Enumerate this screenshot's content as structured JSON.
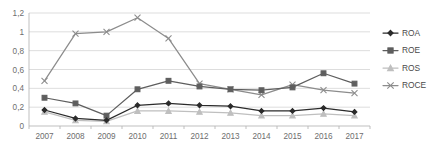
{
  "chart_data": {
    "type": "line",
    "title": "",
    "xlabel": "",
    "ylabel": "",
    "x": [
      "2007",
      "2008",
      "2009",
      "2010",
      "2011",
      "2012",
      "2013",
      "2014",
      "2015",
      "2016",
      "2017"
    ],
    "categories": [
      "2007",
      "2008",
      "2009",
      "2010",
      "2011",
      "2012",
      "2013",
      "2014",
      "2015",
      "2016",
      "2017"
    ],
    "ylim": [
      0,
      1.2
    ],
    "yticks": [
      0,
      0.2,
      0.4,
      0.6,
      0.8,
      1,
      1.2
    ],
    "ytick_labels": [
      "0",
      "0,2",
      "0,4",
      "0,6",
      "0,8",
      "1",
      "1,2"
    ],
    "grid": true,
    "legend_position": "right",
    "decimal_separator": ",",
    "series": [
      {
        "name": "ROA",
        "color": "#2b2b2b",
        "marker": "diamond",
        "values": [
          0.17,
          0.08,
          0.06,
          0.22,
          0.24,
          0.22,
          0.21,
          0.16,
          0.16,
          0.19,
          0.15
        ]
      },
      {
        "name": "ROE",
        "color": "#5e5e5e",
        "marker": "square",
        "values": [
          0.3,
          0.24,
          0.11,
          0.39,
          0.48,
          0.42,
          0.39,
          0.38,
          0.41,
          0.56,
          0.45
        ]
      },
      {
        "name": "ROS",
        "color": "#bfbfbf",
        "marker": "triangle",
        "values": [
          0.15,
          0.06,
          0.05,
          0.16,
          0.16,
          0.15,
          0.14,
          0.11,
          0.11,
          0.13,
          0.11
        ]
      },
      {
        "name": "ROCE",
        "color": "#8c8c8c",
        "marker": "x",
        "values": [
          0.48,
          0.98,
          1.0,
          1.15,
          0.93,
          0.45,
          0.39,
          0.33,
          0.44,
          0.38,
          0.35
        ]
      }
    ]
  },
  "legend": {
    "items": [
      {
        "label": "ROA"
      },
      {
        "label": "ROE"
      },
      {
        "label": "ROS"
      },
      {
        "label": "ROCE"
      }
    ]
  }
}
